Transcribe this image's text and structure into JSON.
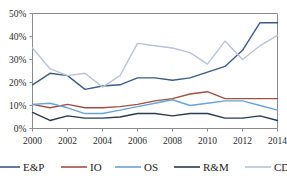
{
  "chart_data": {
    "type": "line",
    "title": "",
    "xlabel": "",
    "ylabel": "",
    "x": [
      2000,
      2001,
      2002,
      2003,
      2004,
      2005,
      2006,
      2007,
      2008,
      2009,
      2010,
      2011,
      2012,
      2013,
      2014
    ],
    "xtick_labels": [
      "2000",
      "2002",
      "2004",
      "2006",
      "2008",
      "2010",
      "2012",
      "2014"
    ],
    "xtick_values": [
      2000,
      2002,
      2004,
      2006,
      2008,
      2010,
      2012,
      2014
    ],
    "ytick_labels": [
      "0%",
      "10%",
      "20%",
      "30%",
      "40%",
      "50%"
    ],
    "ytick_values": [
      0,
      10,
      20,
      30,
      40,
      50
    ],
    "ylim": [
      0,
      50
    ],
    "xlim": [
      2000,
      2014
    ],
    "grid": false,
    "legend_position": "bottom",
    "series": [
      {
        "name": "E&P",
        "color": "#3d5a87",
        "values": [
          19,
          24,
          23,
          17,
          18.5,
          19,
          22,
          22,
          21,
          22,
          24.5,
          27,
          34,
          46,
          46
        ]
      },
      {
        "name": "IO",
        "color": "#9e5146",
        "values": [
          10.5,
          9,
          10.5,
          9,
          9,
          9.5,
          10.5,
          12,
          13,
          15,
          16,
          13,
          13,
          13,
          13
        ]
      },
      {
        "name": "OS",
        "color": "#6aa3d5",
        "values": [
          10.5,
          11,
          9,
          6.5,
          6.5,
          8,
          9.5,
          11,
          12.5,
          10,
          11,
          12,
          12,
          10,
          8
        ]
      },
      {
        "name": "R&M",
        "color": "#2a3a52",
        "values": [
          7,
          3.5,
          5.5,
          4.5,
          4.5,
          5,
          6.5,
          6.5,
          5.5,
          6.5,
          6.5,
          4.5,
          4.5,
          5.5,
          3.5
        ]
      },
      {
        "name": "CD",
        "color": "#b9c4d8",
        "values": [
          35,
          26,
          23,
          24,
          18,
          23,
          37,
          36,
          35,
          33,
          28,
          38,
          30,
          36,
          40.5
        ]
      }
    ]
  },
  "legend": {
    "items": [
      {
        "label": "E&P",
        "color": "#3d5a87"
      },
      {
        "label": "IO",
        "color": "#9e5146"
      },
      {
        "label": "OS",
        "color": "#6aa3d5"
      },
      {
        "label": "R&M",
        "color": "#2a3a52"
      },
      {
        "label": "CD",
        "color": "#b9c4d8"
      }
    ]
  },
  "axes": {
    "frame_color": "#8a8a8a"
  }
}
